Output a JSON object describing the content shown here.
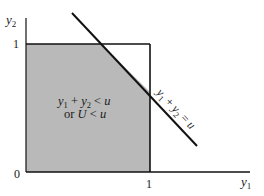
{
  "figure": {
    "type": "region-diagram",
    "colors": {
      "shade": "#b9b9b9",
      "line": "#111111",
      "background": "#ffffff",
      "text": "#1a1a1a"
    },
    "axes": {
      "x_label": "y",
      "x_label_sub": "1",
      "y_label": "y",
      "y_label_sub": "2",
      "origin_label": "0",
      "x_tick_label": "1",
      "y_tick_label": "1"
    },
    "line_label": {
      "part1": "y",
      "sub1": "1",
      "plus": " + ",
      "part2": "y",
      "sub2": "2",
      "eq": " = ",
      "rhs": "u"
    },
    "region_label": {
      "line1_a": "y",
      "line1_sub_a": "1",
      "line1_plus": " + ",
      "line1_b": "y",
      "line1_sub_b": "2",
      "line1_lt": " < ",
      "line1_rhs": "u",
      "line2_or": "or ",
      "line2_U": "U",
      "line2_lt": " < ",
      "line2_rhs": "u"
    }
  }
}
